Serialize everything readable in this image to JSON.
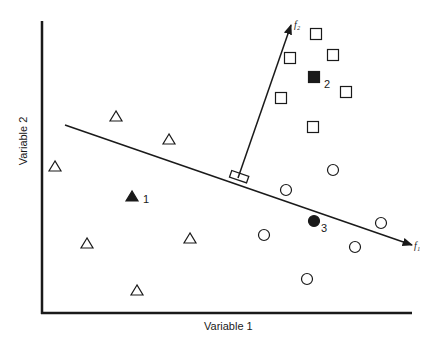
{
  "axes": {
    "x_label": "Variable 1",
    "y_label": "Variable 2"
  },
  "functions": {
    "f1_label": "f₁",
    "f2_label": "f₂"
  },
  "groups": {
    "triangles": {
      "shape": "triangle",
      "open_points": [
        [
          116,
          116
        ],
        [
          169,
          139
        ],
        [
          55,
          166
        ],
        [
          87,
          243
        ],
        [
          190,
          238
        ],
        [
          137,
          290
        ]
      ],
      "highlighted": {
        "label": "1",
        "point": [
          132,
          196
        ]
      }
    },
    "squares": {
      "shape": "square",
      "open_points": [
        [
          316,
          34
        ],
        [
          290,
          58
        ],
        [
          333,
          55
        ],
        [
          281,
          98
        ],
        [
          346,
          92
        ],
        [
          313,
          127
        ]
      ],
      "highlighted": {
        "label": "2",
        "point": [
          314,
          77
        ]
      }
    },
    "circles": {
      "shape": "circle",
      "open_points": [
        [
          286,
          190
        ],
        [
          333,
          170
        ],
        [
          264,
          235
        ],
        [
          381,
          223
        ],
        [
          355,
          247
        ],
        [
          307,
          279
        ]
      ],
      "highlighted": {
        "label": "3",
        "point": [
          314,
          221
        ]
      }
    }
  },
  "colors": {
    "ink": "#1a1a1a",
    "background": "#ffffff"
  }
}
